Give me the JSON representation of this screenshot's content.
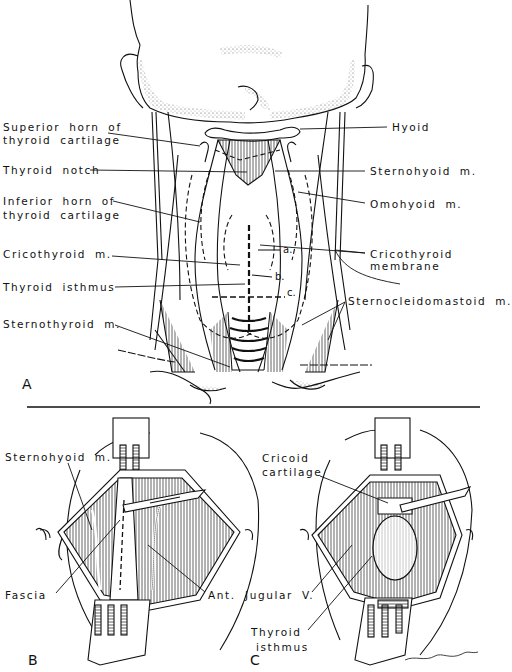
{
  "figure": {
    "panels": [
      "A",
      "B",
      "C"
    ],
    "divider": true
  },
  "panel_a": {
    "letter": "A",
    "labels_left": {
      "superior_horn_1": "Superior horn of",
      "superior_horn_2": "thyroid cartilage",
      "thyroid_notch": "Thyroid notch",
      "inferior_horn_1": "Inferior horn of",
      "inferior_horn_2": "thyroid cartilage",
      "cricothyroid_m": "Cricothyroid m.",
      "thyroid_isthmus": "Thyroid isthmus",
      "sternothyroid_m": "Sternothyroid m."
    },
    "labels_right": {
      "hyoid": "Hyoid",
      "sternohyoid_m": "Sternohyoid m.",
      "omohyoid_m": "Omohyoid m.",
      "cricothyroid_membrane_1": "Cricothyroid",
      "cricothyroid_membrane_2": "membrane",
      "sternocleidomastoid_m": "Sternocleidomastoid m."
    },
    "incision_markers": [
      "a.",
      "b.",
      "c."
    ]
  },
  "panel_b": {
    "letter": "B",
    "labels": {
      "sternohyoid_m": "Sternohyoid m.",
      "fascia": "Fascia",
      "ant": "Ant."
    }
  },
  "panel_c": {
    "letter": "C",
    "labels": {
      "cricoid_1": "Cricoid",
      "cricoid_2": "cartilage",
      "jugular_v": "Jugular V.",
      "thyroid_isthmus_1": "Thyroid",
      "thyroid_isthmus_2": "isthmus"
    },
    "signature": "Archambault"
  }
}
